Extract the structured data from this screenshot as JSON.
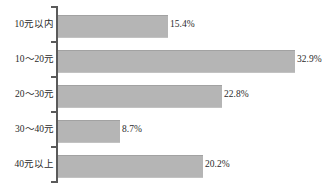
{
  "chart_data": {
    "type": "bar",
    "orientation": "horizontal",
    "title": "",
    "subtitle": "",
    "xlabel": "",
    "ylabel": "",
    "categories": [
      "10元以内",
      "10～20元",
      "20～30元",
      "30～40元",
      "40元以上"
    ],
    "values": [
      15.4,
      32.9,
      22.8,
      8.7,
      20.2
    ],
    "value_labels": [
      "15.4%",
      "32.9%",
      "22.8%",
      "8.7%",
      "20.2%"
    ],
    "unit": "%",
    "xlim": [
      0,
      35
    ],
    "grid": false,
    "legend": false,
    "legend_position": "none",
    "series": [
      {
        "name": "",
        "values": [
          15.4,
          32.9,
          22.8,
          8.7,
          20.2
        ]
      }
    ],
    "colors": {
      "bar_fill": "#b5b5b5",
      "bar_edge_top": "#a2a2a2",
      "axis": "#5a5a5a",
      "text": "#2b2b2b",
      "background": "#ffffff"
    }
  },
  "rows": [
    {
      "label": "10元以内",
      "value_label": "15.4%",
      "bar_px": 110,
      "label_left_px": 170
    },
    {
      "label": "10～20元",
      "value_label": "32.9%",
      "bar_px": 237,
      "label_left_px": 297
    },
    {
      "label": "20～30元",
      "value_label": "22.8%",
      "bar_px": 164,
      "label_left_px": 224
    },
    {
      "label": "30～40元",
      "value_label": "8.7%",
      "bar_px": 62,
      "label_left_px": 122
    },
    {
      "label": "40元以上",
      "value_label": "20.2%",
      "bar_px": 145,
      "label_left_px": 205
    }
  ]
}
